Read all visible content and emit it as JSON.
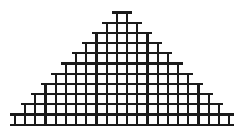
{
  "figure": {
    "name": "stepped-pyramid-grid",
    "canvas": {
      "width": 244,
      "height": 133,
      "background": "#ffffff"
    },
    "stroke": {
      "color": "#1a1a1a",
      "width": 2.1,
      "cap_overhang": 4.5
    },
    "geometry": {
      "rows": 11,
      "cell_size": 10.2,
      "cells_per_row_rule": "2n-1",
      "cells_per_row": [
        1,
        3,
        5,
        7,
        9,
        11,
        13,
        15,
        17,
        19,
        21
      ],
      "origin_x": 122,
      "top_y": 12.5,
      "bottom_y": 120.5
    }
  },
  "chart_data": {
    "type": "bar",
    "title": "",
    "xlabel": "",
    "ylabel": "",
    "categories": [
      "1",
      "2",
      "3",
      "4",
      "5",
      "6",
      "7",
      "8",
      "9",
      "10",
      "11"
    ],
    "values": [
      1,
      3,
      5,
      7,
      9,
      11,
      13,
      15,
      17,
      19,
      21
    ],
    "ylim": [
      0,
      21
    ],
    "grid": true,
    "legend": "none"
  }
}
